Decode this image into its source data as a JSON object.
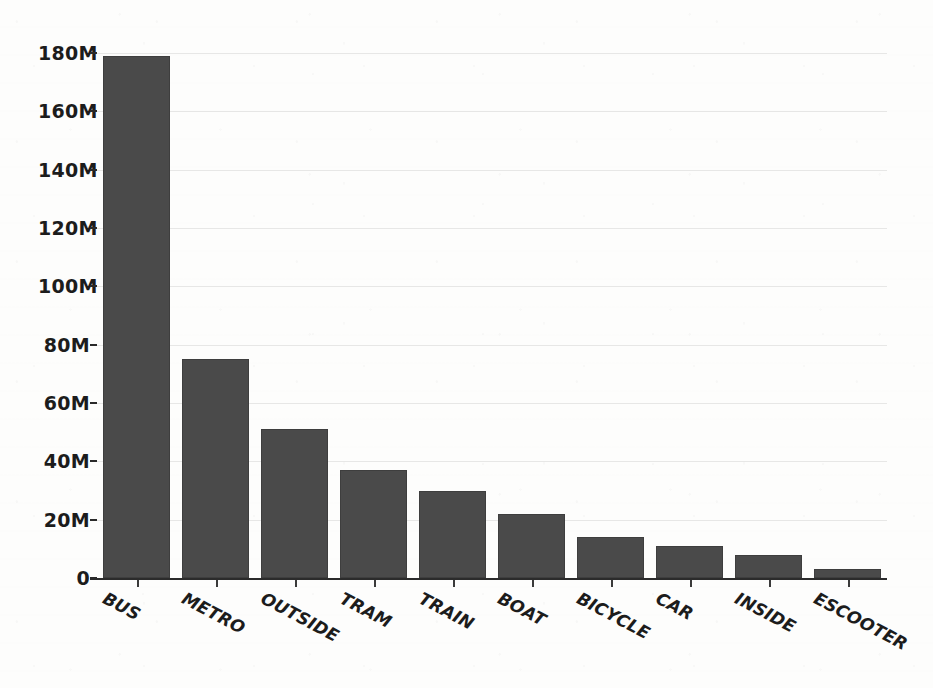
{
  "chart_data": {
    "type": "bar",
    "title": "",
    "subtitle": "",
    "xlabel": "",
    "ylabel": "",
    "categories": [
      "BUS",
      "METRO",
      "OUTSIDE",
      "TRAM",
      "TRAIN",
      "BOAT",
      "BICYCLE",
      "CAR",
      "INSIDE",
      "ESCOOTER"
    ],
    "values": [
      179000000,
      75000000,
      51000000,
      37000000,
      30000000,
      22000000,
      14000000,
      11000000,
      8000000,
      3000000
    ],
    "value_labels": [
      "179M",
      "75M",
      "51M",
      "37M",
      "30M",
      "22M",
      "14M",
      "11M",
      "8M",
      "3M"
    ],
    "ylim": [
      0,
      180000000
    ],
    "ytick_values": [
      0,
      20000000,
      40000000,
      60000000,
      80000000,
      100000000,
      120000000,
      140000000,
      160000000,
      180000000
    ],
    "ytick_labels": [
      "0",
      "20M",
      "40M",
      "60M",
      "80M",
      "100M",
      "120M",
      "140M",
      "160M",
      "180M"
    ],
    "grid": true,
    "grid_axis": "y",
    "legend": false,
    "legend_position": "none",
    "bar_color": "#4a4a4a",
    "background_color": "#fdfdfc",
    "axis_color": "#2b2b2b",
    "xtick_label_rotation": 28,
    "series": [
      {
        "name": "trips",
        "values": [
          179000000,
          75000000,
          51000000,
          37000000,
          30000000,
          22000000,
          14000000,
          11000000,
          8000000,
          3000000
        ]
      }
    ]
  },
  "colors": {
    "bar": "#4a4a4a",
    "axis": "#2b2b2b",
    "grid": "#bdbdbd",
    "text": "#1c1c1c",
    "background": "#fdfdfc"
  }
}
